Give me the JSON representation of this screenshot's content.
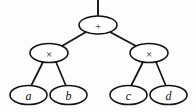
{
  "diagram": {
    "kind": "expression-tree",
    "caption": "",
    "background_color": "#fdfdfc",
    "line_color": "#141414",
    "node_fill_color": "#ffffff",
    "expression": "a × b + c × d",
    "root_stub": {
      "present": true,
      "x": 98,
      "y_top": 0,
      "y_bottom": 16
    },
    "nodes": [
      {
        "id": "root",
        "label": "+",
        "role": "operator",
        "cx": 98,
        "cy": 25,
        "rx": 19,
        "ry": 9
      },
      {
        "id": "mul-left",
        "label": "×",
        "role": "operator",
        "cx": 49,
        "cy": 53,
        "rx": 19,
        "ry": 9.5
      },
      {
        "id": "mul-right",
        "label": "×",
        "role": "operator",
        "cx": 149,
        "cy": 53,
        "rx": 19,
        "ry": 9.5
      },
      {
        "id": "leaf-a",
        "label": "a",
        "role": "operand",
        "cx": 28.5,
        "cy": 95,
        "rx": 18.5,
        "ry": 9.5
      },
      {
        "id": "leaf-b",
        "label": "b",
        "role": "operand",
        "cx": 68.5,
        "cy": 95,
        "rx": 18.5,
        "ry": 9.5
      },
      {
        "id": "leaf-c",
        "label": "c",
        "role": "operand",
        "cx": 128.5,
        "cy": 95,
        "rx": 18.5,
        "ry": 9.5
      },
      {
        "id": "leaf-d",
        "label": "d",
        "role": "operand",
        "cx": 168.5,
        "cy": 95,
        "rx": 18.5,
        "ry": 9.5
      }
    ],
    "edges": [
      {
        "id": "edge-root-mul-left",
        "from": "root",
        "to": "mul-left",
        "x1": 86,
        "y1": 32,
        "x2": 62,
        "y2": 46
      },
      {
        "id": "edge-root-mul-right",
        "from": "root",
        "to": "mul-right",
        "x1": 110,
        "y1": 32,
        "x2": 136,
        "y2": 46
      },
      {
        "id": "edge-mul-left-a",
        "from": "mul-left",
        "to": "leaf-a",
        "x1": 43,
        "y1": 62,
        "x2": 31,
        "y2": 86
      },
      {
        "id": "edge-mul-left-b",
        "from": "mul-left",
        "to": "leaf-b",
        "x1": 56,
        "y1": 62,
        "x2": 66,
        "y2": 86
      },
      {
        "id": "edge-mul-right-c",
        "from": "mul-right",
        "to": "leaf-c",
        "x1": 143,
        "y1": 62,
        "x2": 131,
        "y2": 86
      },
      {
        "id": "edge-mul-right-d",
        "from": "mul-right",
        "to": "leaf-d",
        "x1": 156,
        "y1": 62,
        "x2": 166,
        "y2": 86
      }
    ]
  }
}
